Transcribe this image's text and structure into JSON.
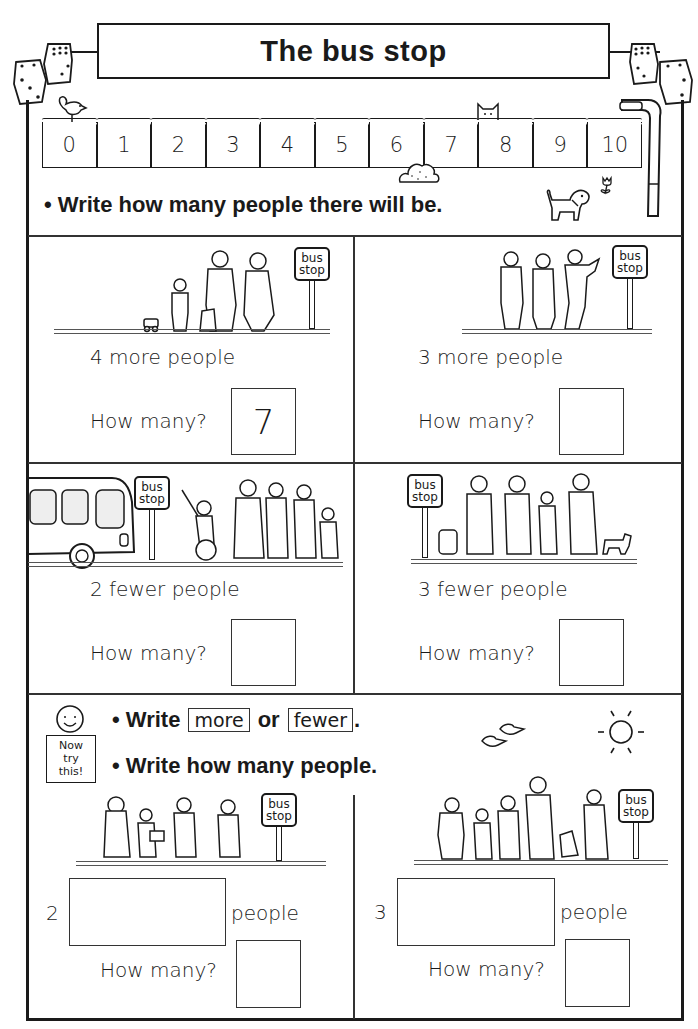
{
  "worksheet": {
    "title": "The bus stop",
    "number_line": [
      "0",
      "1",
      "2",
      "3",
      "4",
      "5",
      "6",
      "7",
      "8",
      "9",
      "10"
    ],
    "main_instruction": "• Write how many people there will be.",
    "sign_line1": "bus",
    "sign_line2": "stop",
    "problems": [
      {
        "change": "4 more people",
        "question": "How many?",
        "answer": "7"
      },
      {
        "change": "3 more people",
        "question": "How many?",
        "answer": ""
      },
      {
        "change": "2 fewer people",
        "question": "How many?",
        "answer": ""
      },
      {
        "change": "3 fewer people",
        "question": "How many?",
        "answer": ""
      }
    ],
    "now_try_this": {
      "badge_lines": [
        "Now",
        "try",
        "this!"
      ],
      "instruction1_prefix": "• Write",
      "word_more": "more",
      "word_or": "or",
      "word_fewer": "fewer",
      "instruction1_suffix": ".",
      "instruction2": "• Write how many people.",
      "problems": [
        {
          "number": "2",
          "blank": "",
          "unit": "people",
          "question": "How many?",
          "answer": ""
        },
        {
          "number": "3",
          "blank": "",
          "unit": "people",
          "question": "How many?",
          "answer": ""
        }
      ]
    }
  }
}
